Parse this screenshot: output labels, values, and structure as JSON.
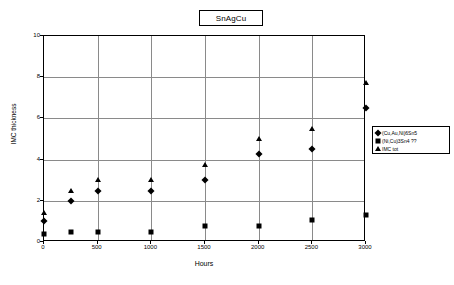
{
  "chart_data": {
    "type": "scatter",
    "title": "SnAgCu",
    "xlabel": "Hours",
    "ylabel": "IMC thickness",
    "xlim": [
      0,
      3000
    ],
    "ylim": [
      0,
      10
    ],
    "xticks": [
      0,
      500,
      1000,
      1500,
      2000,
      2500,
      3000
    ],
    "yticks": [
      0,
      2,
      4,
      6,
      8,
      10
    ],
    "grid": true,
    "legend_position": "right",
    "x": [
      0,
      250,
      500,
      1000,
      1500,
      2000,
      2500,
      3000
    ],
    "series": [
      {
        "name": "(Cu,Au,Ni)6Sn5",
        "marker": "diamond",
        "values": [
          1.0,
          2.0,
          2.5,
          2.5,
          3.0,
          4.25,
          4.5,
          6.5
        ]
      },
      {
        "name": "(Ni,Cu)3Sn4 ??",
        "marker": "square",
        "values": [
          0.4,
          0.5,
          0.5,
          0.5,
          0.8,
          0.8,
          1.05,
          1.3
        ]
      },
      {
        "name": "IMC tot",
        "marker": "triangle",
        "values": [
          1.4,
          2.5,
          3.0,
          3.0,
          3.75,
          5.0,
          5.5,
          7.7
        ]
      }
    ]
  },
  "colors": {
    "marker": "#000000",
    "grid": "#8a8a8a",
    "axis": "#000000",
    "background": "#ffffff"
  }
}
